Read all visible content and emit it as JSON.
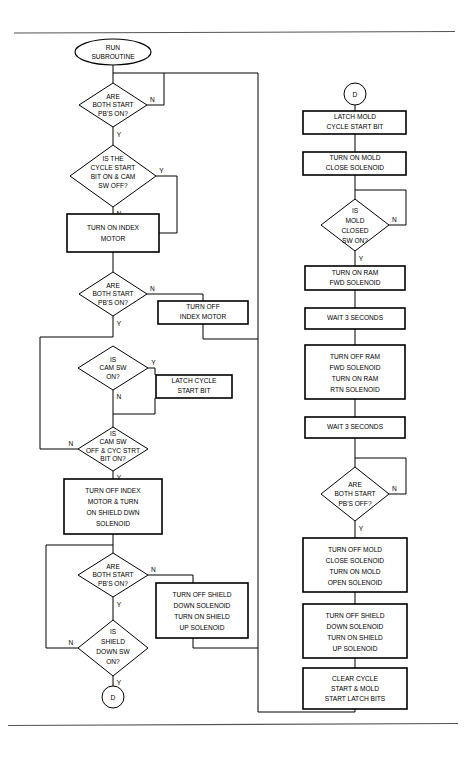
{
  "page": {
    "width": 468,
    "height": 762,
    "background": "#ffffff",
    "line_color": "#000000",
    "rule_color": "#555555"
  },
  "rules": {
    "top_y": 33,
    "bottom_y": 725
  },
  "branch_labels": {
    "yes": "Y",
    "no": "N"
  },
  "left_column": {
    "start_terminal": {
      "label_line1": "RUN",
      "label_line2": "SUBROUTINE"
    },
    "d1": {
      "lines": [
        "ARE",
        "BOTH START",
        "PB'S ON?"
      ],
      "no_label": "N",
      "yes_label": "Y"
    },
    "d2": {
      "lines": [
        "IS THE",
        "CYCLE START",
        "BIT ON & CAM",
        "SW OFF?"
      ],
      "yes_label": "Y",
      "no_label": "N"
    },
    "p1": {
      "lines": [
        "TURN ON INDEX",
        "MOTOR"
      ]
    },
    "d3": {
      "lines": [
        "ARE",
        "BOTH START",
        "PB'S ON?"
      ],
      "no_label": "N",
      "yes_label": "Y"
    },
    "p2": {
      "lines": [
        "TURN OFF",
        "INDEX MOTOR"
      ]
    },
    "d4": {
      "lines": [
        "IS",
        "CAM SW",
        "ON?"
      ],
      "yes_label": "Y",
      "no_label": "N"
    },
    "p3": {
      "lines": [
        "LATCH CYCLE",
        "START BIT"
      ]
    },
    "d5": {
      "lines": [
        "IS",
        "CAM SW",
        "OFF & CYC STRT",
        "BIT ON?"
      ],
      "no_label": "N",
      "yes_label": "Y"
    },
    "p4": {
      "lines": [
        "TURN OFF INDEX",
        "MOTOR & TURN",
        "ON SHIELD DWN",
        "SOLENOID"
      ]
    },
    "d6": {
      "lines": [
        "ARE",
        "BOTH START",
        "PB'S ON?"
      ],
      "no_label": "N",
      "yes_label": "Y"
    },
    "p5": {
      "lines": [
        "TURN OFF SHIELD",
        "DOWN SOLENOID",
        "TURN ON SHIELD",
        "UP SOLENOID"
      ]
    },
    "d7": {
      "lines": [
        "IS",
        "SHIELD",
        "DOWN SW",
        "ON?"
      ],
      "no_label": "N",
      "yes_label": "Y"
    },
    "end_connector": {
      "label": "D"
    }
  },
  "right_column": {
    "start_connector": {
      "label": "D"
    },
    "p6": {
      "lines": [
        "LATCH MOLD",
        "CYCLE START BIT"
      ]
    },
    "p7": {
      "lines": [
        "TURN ON MOLD",
        "CLOSE SOLENOID"
      ]
    },
    "d8": {
      "lines": [
        "IS",
        "MOLD",
        "CLOSED",
        "SW ON?"
      ],
      "no_label": "N",
      "yes_label": "Y"
    },
    "p8": {
      "lines": [
        "TURN ON RAM",
        "FWD SOLENOID"
      ]
    },
    "p9": {
      "lines": [
        "WAIT 3 SECONDS"
      ]
    },
    "p10": {
      "lines": [
        "TURN OFF RAM",
        "FWD SOLENOID",
        "TURN ON RAM",
        "RTN SOLENOID"
      ]
    },
    "p11": {
      "lines": [
        "WAIT 3 SECONDS"
      ]
    },
    "d9": {
      "lines": [
        "ARE",
        "BOTH START",
        "PB'S OFF?"
      ],
      "no_label": "N",
      "yes_label": "Y"
    },
    "p12": {
      "lines": [
        "TURN OFF MOLD",
        "CLOSE SOLENOID",
        "TURN ON MOLD",
        "OPEN SOLENOID"
      ]
    },
    "p13": {
      "lines": [
        "TURN OFF SHIELD",
        "DOWN SOLENOID",
        "TURN ON SHIELD",
        "UP SOLENOID"
      ]
    },
    "p14": {
      "lines": [
        "CLEAR CYCLE",
        "START & MOLD",
        "START LATCH BITS"
      ]
    }
  }
}
